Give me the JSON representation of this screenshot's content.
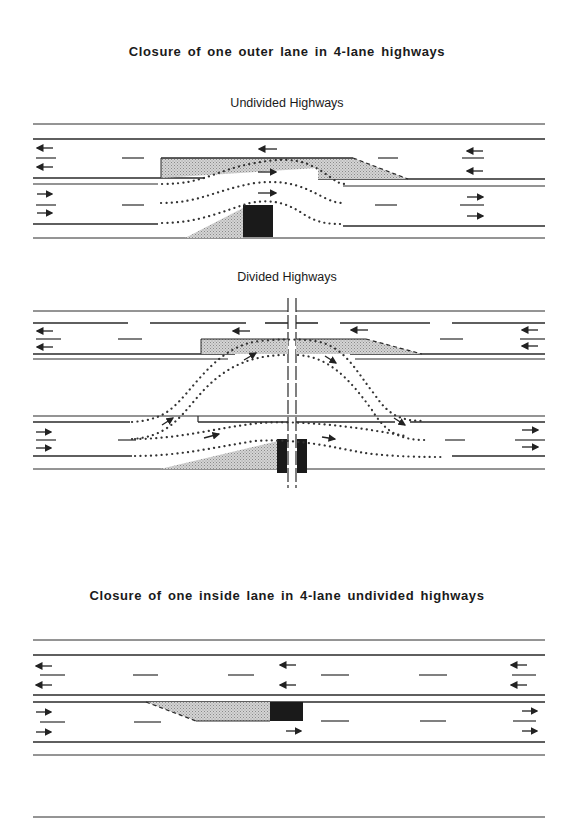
{
  "section_outer": {
    "title": "Closure of one outer lane in 4-lane highways",
    "undivided": {
      "subtitle": "Undivided Highways"
    },
    "divided": {
      "subtitle": "Divided Highways"
    }
  },
  "section_inside": {
    "title": "Closure of one inside lane in 4-lane undivided highways"
  },
  "legend_semantics": {
    "shaded_taper": "closed lane taper (stippled)",
    "black_block": "work zone / obstruction",
    "dotted_paths": "vehicle paths",
    "arrows": "direction of travel"
  },
  "colors": {
    "line": "#2a2a2a",
    "taper": "#b8b8b8",
    "block": "#1a1a1a",
    "background": "#ffffff"
  }
}
